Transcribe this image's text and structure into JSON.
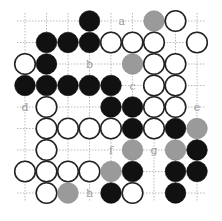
{
  "diagram": {
    "type": "go-board-diagram",
    "grid": {
      "x0": 25,
      "y0": 21,
      "step": 21.5,
      "cols": 9,
      "rows": 9
    },
    "colors": {
      "black": "#111111",
      "white": "#ffffff",
      "gray": "#9a9a9a",
      "line": "#222222",
      "dotted": "#aaaaaa"
    },
    "stones": [
      {
        "c": 3,
        "r": 0,
        "color": "black"
      },
      {
        "c": 6,
        "r": 0,
        "color": "gray"
      },
      {
        "c": 7,
        "r": 0,
        "color": "white"
      },
      {
        "c": 1,
        "r": 1,
        "color": "black"
      },
      {
        "c": 2,
        "r": 1,
        "color": "black"
      },
      {
        "c": 3,
        "r": 1,
        "color": "black"
      },
      {
        "c": 4,
        "r": 1,
        "color": "white"
      },
      {
        "c": 5,
        "r": 1,
        "color": "white"
      },
      {
        "c": 6,
        "r": 1,
        "color": "white"
      },
      {
        "c": 8,
        "r": 1,
        "color": "white"
      },
      {
        "c": 0,
        "r": 2,
        "color": "white"
      },
      {
        "c": 1,
        "r": 2,
        "color": "black"
      },
      {
        "c": 5,
        "r": 2,
        "color": "gray"
      },
      {
        "c": 6,
        "r": 2,
        "color": "white"
      },
      {
        "c": 7,
        "r": 2,
        "color": "white"
      },
      {
        "c": 0,
        "r": 3,
        "color": "black"
      },
      {
        "c": 1,
        "r": 3,
        "color": "black"
      },
      {
        "c": 2,
        "r": 3,
        "color": "black"
      },
      {
        "c": 3,
        "r": 3,
        "color": "black"
      },
      {
        "c": 4,
        "r": 3,
        "color": "black"
      },
      {
        "c": 6,
        "r": 3,
        "color": "white"
      },
      {
        "c": 7,
        "r": 3,
        "color": "white"
      },
      {
        "c": 1,
        "r": 4,
        "color": "white"
      },
      {
        "c": 4,
        "r": 4,
        "color": "black"
      },
      {
        "c": 5,
        "r": 4,
        "color": "black"
      },
      {
        "c": 6,
        "r": 4,
        "color": "white"
      },
      {
        "c": 7,
        "r": 4,
        "color": "white"
      },
      {
        "c": 1,
        "r": 5,
        "color": "white"
      },
      {
        "c": 2,
        "r": 5,
        "color": "white"
      },
      {
        "c": 3,
        "r": 5,
        "color": "white"
      },
      {
        "c": 4,
        "r": 5,
        "color": "white"
      },
      {
        "c": 5,
        "r": 5,
        "color": "black"
      },
      {
        "c": 6,
        "r": 5,
        "color": "white"
      },
      {
        "c": 7,
        "r": 5,
        "color": "black"
      },
      {
        "c": 8,
        "r": 5,
        "color": "gray"
      },
      {
        "c": 1,
        "r": 6,
        "color": "white"
      },
      {
        "c": 5,
        "r": 6,
        "color": "gray"
      },
      {
        "c": 7,
        "r": 6,
        "color": "gray"
      },
      {
        "c": 8,
        "r": 6,
        "color": "black"
      },
      {
        "c": 0,
        "r": 7,
        "color": "white"
      },
      {
        "c": 1,
        "r": 7,
        "color": "white"
      },
      {
        "c": 2,
        "r": 7,
        "color": "white"
      },
      {
        "c": 3,
        "r": 7,
        "color": "white"
      },
      {
        "c": 4,
        "r": 7,
        "color": "gray"
      },
      {
        "c": 5,
        "r": 7,
        "color": "black"
      },
      {
        "c": 7,
        "r": 7,
        "color": "black"
      },
      {
        "c": 8,
        "r": 7,
        "color": "black"
      },
      {
        "c": 1,
        "r": 8,
        "color": "white"
      },
      {
        "c": 2,
        "r": 8,
        "color": "gray"
      },
      {
        "c": 4,
        "r": 8,
        "color": "black"
      },
      {
        "c": 5,
        "r": 8,
        "color": "white"
      },
      {
        "c": 7,
        "r": 8,
        "color": "black"
      }
    ],
    "labels": [
      {
        "c": 4.5,
        "r": 0,
        "text": "a"
      },
      {
        "c": 3,
        "r": 2,
        "text": "b"
      },
      {
        "c": 5,
        "r": 3,
        "text": "c"
      },
      {
        "c": 0,
        "r": 4,
        "text": "d"
      },
      {
        "c": 8,
        "r": 4,
        "text": "e"
      },
      {
        "c": 4,
        "r": 6,
        "text": "f"
      },
      {
        "c": 6,
        "r": 6,
        "text": "g"
      },
      {
        "c": 3,
        "r": 8,
        "text": "h"
      }
    ]
  }
}
